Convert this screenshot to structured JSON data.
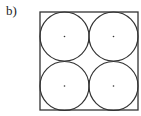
{
  "figure": {
    "label": "b)",
    "square": {
      "x": 40,
      "y": 12,
      "size": 98
    },
    "circles": [
      {
        "cx": 64.5,
        "cy": 36.5,
        "r": 24.5
      },
      {
        "cx": 113.5,
        "cy": 36.5,
        "r": 24.5
      },
      {
        "cx": 64.5,
        "cy": 86.5,
        "r": 24.5
      },
      {
        "cx": 113.5,
        "cy": 86.5,
        "r": 24.5
      }
    ],
    "stroke_color": "#333333"
  }
}
